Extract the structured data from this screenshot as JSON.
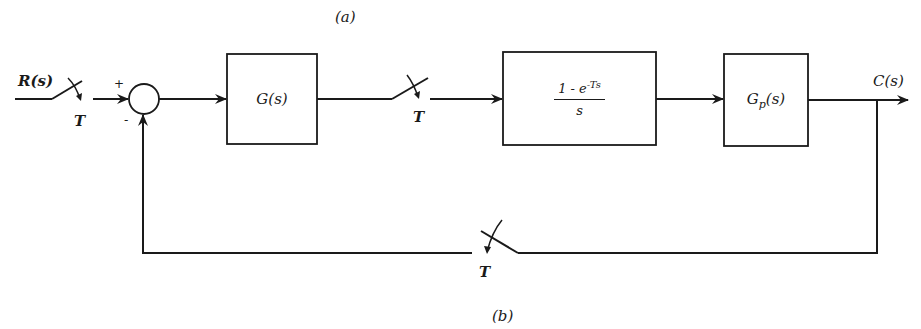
{
  "figure": {
    "panel_label_top": "(a)",
    "panel_label_bottom": "(b)",
    "input_signal": "R(s)",
    "output_signal": "C(s)",
    "summing_junction": {
      "plus_sign": "+",
      "minus_sign": "-"
    },
    "blocks": [
      {
        "id": "controller",
        "label": "G(s)"
      },
      {
        "id": "zoh",
        "numerator": "1 - e",
        "exponent": "-Ts",
        "denominator": "s"
      },
      {
        "id": "plant",
        "label_main": "G",
        "label_sub": "p",
        "label_arg": "(s)"
      }
    ],
    "samplers": [
      {
        "id": "input-sampler",
        "period": "T"
      },
      {
        "id": "controller-sampler",
        "period": "T"
      },
      {
        "id": "feedback-sampler",
        "period": "T"
      }
    ]
  }
}
